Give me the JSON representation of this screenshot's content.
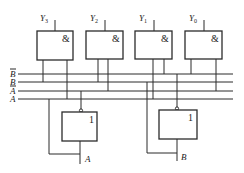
{
  "diagram": {
    "type": "2-to-4 line decoder logic diagram",
    "and_gates": [
      {
        "output": "Y",
        "subscript": "3",
        "symbol": "&",
        "inputs": [
          "B",
          "A"
        ]
      },
      {
        "output": "Y",
        "subscript": "2",
        "symbol": "&",
        "inputs": [
          "B",
          "A_bar"
        ]
      },
      {
        "output": "Y",
        "subscript": "1",
        "symbol": "&",
        "inputs": [
          "B_bar",
          "A"
        ]
      },
      {
        "output": "Y",
        "subscript": "0",
        "symbol": "&",
        "inputs": [
          "B_bar",
          "A_bar"
        ]
      }
    ],
    "bus_lines": [
      {
        "label": "B",
        "inverted": true
      },
      {
        "label": "B",
        "inverted": false
      },
      {
        "label": "A",
        "inverted": true
      },
      {
        "label": "A",
        "inverted": false
      }
    ],
    "inverters": [
      {
        "symbol": "1",
        "input": "A",
        "output": "A_bar"
      },
      {
        "symbol": "1",
        "input": "B",
        "output": "B_bar"
      }
    ]
  }
}
